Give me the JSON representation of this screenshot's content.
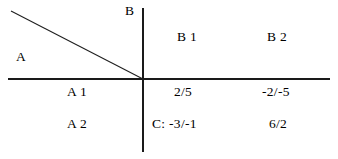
{
  "figure": {
    "type": "payoff-matrix-quadrant-diagram",
    "axis_labels": {
      "vertical": "B",
      "horizontal": "A"
    },
    "column_headers": [
      "B 1",
      "B 2"
    ],
    "row_headers": [
      "A 1",
      "A 2"
    ],
    "cells": [
      {
        "row": "A 1",
        "col": "B 1",
        "value": "2/5"
      },
      {
        "row": "A 1",
        "col": "B 2",
        "value": "-2/-5"
      },
      {
        "row": "A 2",
        "col": "B 1",
        "value": "C: -3/-1"
      },
      {
        "row": "A 2",
        "col": "B 2",
        "value": "6/2"
      }
    ],
    "annotations": {
      "diagonal_note": "diagonal line from upper-left to axis origin"
    },
    "colors": {
      "axis": "#1a1a1a",
      "diagonal": "#1f1f1f",
      "text": "#000000",
      "background": "#ffffff"
    },
    "geometry": {
      "origin_x": 143,
      "origin_y": 79,
      "diagonal_start": [
        11,
        11
      ],
      "diagonal_end": [
        143,
        79
      ]
    }
  }
}
